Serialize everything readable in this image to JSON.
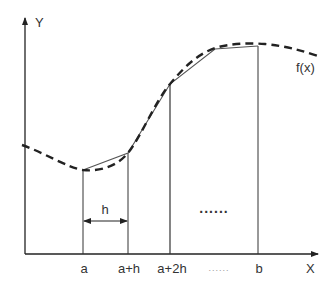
{
  "diagram": {
    "type": "trapezoidal-rule-illustration",
    "axes": {
      "x_label": "X",
      "y_label": "Y"
    },
    "curve_label": "f(x)",
    "interval_label": "h",
    "middle_ellipsis": "......",
    "tick_labels": [
      "a",
      "a+h",
      "a+2h",
      "......",
      "b"
    ],
    "colors": {
      "stroke": "#222222",
      "text": "#333333",
      "background": "#ffffff"
    }
  }
}
